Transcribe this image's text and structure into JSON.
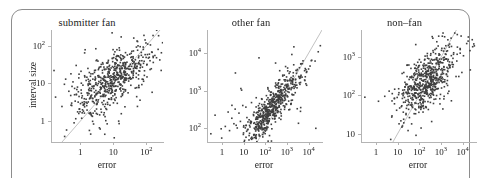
{
  "figure": {
    "background_color": "#ffffff",
    "frame_color": "#8d8d8d",
    "point_color": "#3f3f3f",
    "axis_color": "#b4b4b4",
    "refline_color": "#a8a8a8",
    "text_color": "#1c1c1c"
  },
  "chart_data": [
    {
      "type": "scatter",
      "title": "submitter fan",
      "xlabel": "error",
      "ylabel": "interval size",
      "xscale": "log",
      "yscale": "log",
      "xlim": [
        0.13,
        320
      ],
      "ylim": [
        0.28,
        260
      ],
      "xticks": [
        1,
        10,
        100
      ],
      "xticklabels": [
        "1",
        "10",
        "10^2"
      ],
      "yticks": [
        1,
        10,
        100
      ],
      "yticklabels": [
        "1",
        "10",
        "10^2"
      ],
      "grid": false,
      "legend": "none",
      "reference_line": {
        "type": "identity",
        "label": "y = x"
      },
      "n_points": 520,
      "cloud": {
        "x_center_log10": 1.02,
        "y_center_log10": 1.12,
        "x_sd_log10": 0.52,
        "y_sd_log10": 0.42,
        "correlation": 0.62
      },
      "points": [
        [
          0.16,
          22
        ],
        [
          0.33,
          9.5
        ],
        [
          0.36,
          13
        ],
        [
          0.45,
          6.2
        ],
        [
          0.52,
          18
        ],
        [
          0.6,
          11
        ],
        [
          0.75,
          30
        ],
        [
          0.82,
          8.0
        ],
        [
          0.9,
          14
        ],
        [
          1.05,
          21
        ],
        [
          1.2,
          9.0
        ],
        [
          1.35,
          16
        ],
        [
          1.5,
          12
        ],
        [
          1.7,
          25
        ],
        [
          1.9,
          7.5
        ],
        [
          2.1,
          18
        ],
        [
          2.4,
          13
        ],
        [
          2.7,
          22
        ],
        [
          3.0,
          9.5
        ],
        [
          3.4,
          16
        ],
        [
          3.8,
          27
        ],
        [
          4.2,
          12
        ],
        [
          4.7,
          19
        ],
        [
          5.3,
          15
        ],
        [
          6.0,
          24
        ],
        [
          6.7,
          11
        ],
        [
          7.5,
          20
        ],
        [
          8.4,
          16
        ],
        [
          9.4,
          28
        ],
        [
          10.5,
          14
        ],
        [
          11.8,
          22
        ],
        [
          13.2,
          18
        ],
        [
          14.8,
          30
        ],
        [
          16.6,
          15
        ],
        [
          18.6,
          25
        ],
        [
          20.8,
          20
        ],
        [
          23.3,
          35
        ],
        [
          26.1,
          18
        ],
        [
          29.2,
          28
        ],
        [
          32.7,
          24
        ],
        [
          36.6,
          42
        ],
        [
          41,
          22
        ],
        [
          46,
          33
        ],
        [
          52,
          28
        ],
        [
          58,
          48
        ],
        [
          65,
          26
        ],
        [
          73,
          40
        ],
        [
          82,
          34
        ],
        [
          92,
          58
        ],
        [
          103,
          31
        ],
        [
          115,
          47
        ],
        [
          129,
          40
        ],
        [
          145,
          68
        ],
        [
          162,
          36
        ],
        [
          181,
          55
        ],
        [
          203,
          48
        ],
        [
          227,
          80
        ],
        [
          255,
          42
        ],
        [
          285,
          65
        ],
        [
          310,
          120
        ],
        [
          4.0,
          0.62
        ],
        [
          5.5,
          0.45
        ],
        [
          6.5,
          0.85
        ],
        [
          1.1,
          1.2
        ],
        [
          0.9,
          1.6
        ],
        [
          2.2,
          1.4
        ],
        [
          3.1,
          2.1
        ],
        [
          0.55,
          2.6
        ],
        [
          0.7,
          3.4
        ],
        [
          1.6,
          3.0
        ]
      ]
    },
    {
      "type": "scatter",
      "title": "other fan",
      "xlabel": "error",
      "ylabel": "",
      "xscale": "log",
      "yscale": "log",
      "xlim": [
        0.2,
        42000
      ],
      "ylim": [
        42,
        42000
      ],
      "xticks": [
        1,
        10,
        100,
        1000,
        10000
      ],
      "xticklabels": [
        "1",
        "10",
        "10^2",
        "10^3",
        "10^4"
      ],
      "yticks": [
        100,
        1000,
        10000
      ],
      "yticklabels": [
        "10^2",
        "10^3",
        "10^4"
      ],
      "grid": false,
      "legend": "none",
      "reference_line": {
        "type": "identity",
        "label": "y = x"
      },
      "n_points": 560,
      "cloud": {
        "x_center_log10": 2.25,
        "y_center_log10": 2.5,
        "x_sd_log10": 0.72,
        "y_sd_log10": 0.55,
        "correlation": 0.9
      },
      "points": [
        [
          0.3,
          70
        ],
        [
          0.9,
          95
        ],
        [
          1.4,
          110
        ],
        [
          2.2,
          85
        ],
        [
          3.5,
          130
        ],
        [
          5.0,
          100
        ],
        [
          7.0,
          150
        ],
        [
          10,
          115
        ],
        [
          14,
          190
        ],
        [
          20,
          140
        ],
        [
          28,
          230
        ],
        [
          40,
          175
        ],
        [
          55,
          290
        ],
        [
          78,
          220
        ],
        [
          110,
          380
        ],
        [
          155,
          300
        ],
        [
          220,
          520
        ],
        [
          310,
          420
        ],
        [
          440,
          700
        ],
        [
          620,
          580
        ],
        [
          880,
          1000
        ],
        [
          1250,
          900
        ],
        [
          1750,
          1500
        ],
        [
          2500,
          1400
        ],
        [
          3500,
          2400
        ],
        [
          5000,
          2300
        ],
        [
          7000,
          3900
        ],
        [
          10000,
          3800
        ],
        [
          14000,
          6500
        ],
        [
          20000,
          6200
        ],
        [
          28000,
          11000
        ],
        [
          35000,
          16000
        ],
        [
          4.0,
          320
        ],
        [
          6.0,
          250
        ],
        [
          9.0,
          400
        ],
        [
          60,
          95
        ],
        [
          90,
          120
        ],
        [
          130,
          1200
        ],
        [
          200,
          95
        ],
        [
          300,
          1600
        ],
        [
          520,
          170
        ],
        [
          750,
          2600
        ]
      ]
    },
    {
      "type": "scatter",
      "title": "non–fan",
      "xlabel": "error",
      "ylabel": "",
      "xscale": "log",
      "yscale": "log",
      "xlim": [
        0.2,
        42000
      ],
      "ylim": [
        6,
        5200
      ],
      "xticks": [
        1,
        10,
        100,
        1000,
        10000
      ],
      "xticklabels": [
        "1",
        "10",
        "10^2",
        "10^3",
        "10^4"
      ],
      "yticks": [
        10,
        100,
        1000
      ],
      "yticklabels": [
        "10",
        "10^2",
        "10^3"
      ],
      "grid": false,
      "legend": "none",
      "reference_line": {
        "type": "identity",
        "label": "y = x"
      },
      "n_points": 540,
      "cloud": {
        "x_center_log10": 2.35,
        "y_center_log10": 2.35,
        "x_sd_log10": 0.62,
        "y_sd_log10": 0.45,
        "correlation": 0.66
      },
      "points": [
        [
          0.3,
          90
        ],
        [
          2.5,
          95
        ],
        [
          4.0,
          130
        ],
        [
          7.0,
          85
        ],
        [
          11,
          150
        ],
        [
          16,
          110
        ],
        [
          24,
          200
        ],
        [
          35,
          145
        ],
        [
          50,
          260
        ],
        [
          72,
          190
        ],
        [
          105,
          330
        ],
        [
          150,
          240
        ],
        [
          215,
          430
        ],
        [
          310,
          300
        ],
        [
          440,
          560
        ],
        [
          630,
          380
        ],
        [
          900,
          720
        ],
        [
          1300,
          480
        ],
        [
          1850,
          900
        ],
        [
          2650,
          620
        ],
        [
          3800,
          1200
        ],
        [
          5400,
          800
        ],
        [
          7700,
          1700
        ],
        [
          11000,
          1100
        ],
        [
          15500,
          2300
        ],
        [
          22000,
          1500
        ],
        [
          28000,
          2900
        ],
        [
          35000,
          2000
        ],
        [
          30,
          12
        ],
        [
          70,
          9
        ],
        [
          120,
          14
        ],
        [
          900,
          60
        ],
        [
          1400,
          95
        ],
        [
          19,
          400
        ],
        [
          27,
          620
        ],
        [
          45,
          300
        ],
        [
          65,
          520
        ]
      ]
    }
  ]
}
